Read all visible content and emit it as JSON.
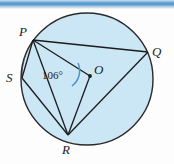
{
  "figure": {
    "type": "circle-geometry-diagram",
    "center_label": "O",
    "angle_label": "106°",
    "angle_value": 106,
    "angle_unit": "degrees",
    "points": [
      {
        "id": "P",
        "label": "P"
      },
      {
        "id": "Q",
        "label": "Q"
      },
      {
        "id": "S",
        "label": "S"
      },
      {
        "id": "R",
        "label": "R"
      },
      {
        "id": "O",
        "label": "O"
      }
    ],
    "colors": {
      "circle_fill": "#cbe6f5",
      "circle_stroke": "#2a2a2a",
      "chord_stroke": "#1b1b1b",
      "angle_arc": "#4f93c9",
      "top_bar": "#4f93c9",
      "label_text": "#1b1b1b",
      "page_background": "#fdfdfd"
    }
  },
  "decor": {
    "top_bar_name": "top-decorative-bar"
  }
}
